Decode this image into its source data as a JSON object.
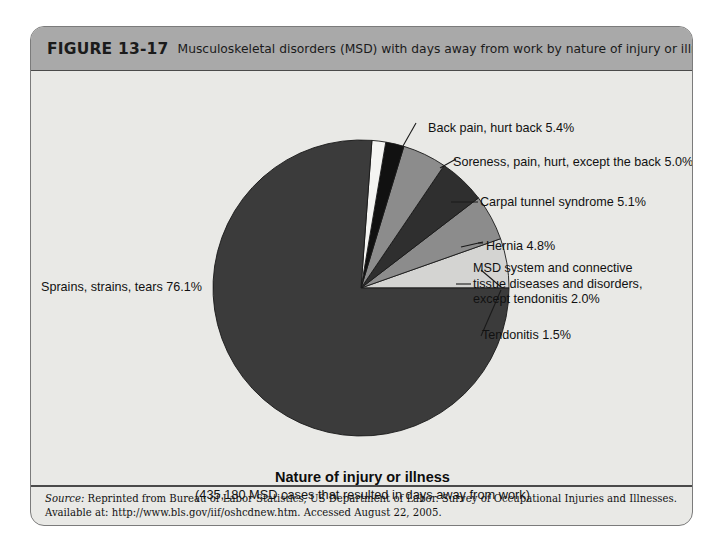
{
  "figure": {
    "number": "FIGURE 13-17",
    "caption": "Musculoskeletal disorders (MSD) with days away from work by nature of injury or illness, 2003."
  },
  "axis": {
    "title": "Nature of injury or illness",
    "subtitle": "(435,180 MSD cases that resulted in days away from work)"
  },
  "source": {
    "label": "Source:",
    "text": " Reprinted from Bureau of Labor Statistics, US Department of Labor. Survey of Occupational Injuries and Illnesses. Available at: http://www.bls.gov/iif/oshcdnew.htm. Accessed August 22, 2005."
  },
  "labels": {
    "sprains": "Sprains, strains, tears 76.1%",
    "back_pain": "Back pain, hurt back 5.4%",
    "soreness": "Soreness, pain, hurt, except the back 5.0%",
    "carpal": "Carpal tunnel syndrome 5.1%",
    "hernia": "Hernia 4.8%",
    "msd_system": "MSD system and connective tissue diseases and disorders, except tendonitis 2.0%",
    "tendonitis": "Tendonitis 1.5%"
  },
  "colors": {
    "header_band": "#a9a9a9",
    "panel_background": "#e9e9e6",
    "border": "#7b7b7b",
    "slice_sprains": "#3b3b3b",
    "slice_back_pain": "#d4d4d2",
    "slice_soreness": "#8c8c8c",
    "slice_carpal": "#2f2f2f",
    "slice_hernia": "#8c8c8c",
    "slice_msd_system": "#111111",
    "slice_tendonitis": "#f4f4f2",
    "leader_line": "#1a1a1a"
  },
  "chart_data": {
    "type": "pie",
    "title": "Musculoskeletal disorders (MSD) with days away from work by nature of injury or illness, 2003",
    "xlabel": "Nature of injury or illness",
    "ylabel": "",
    "total_cases": "435,180",
    "units": "percent of MSD cases",
    "legend_position": "callout-labels",
    "grid": false,
    "start_angle_deg": 0,
    "direction": "clockwise",
    "categories": [
      "Sprains, strains, tears",
      "Back pain, hurt back",
      "Soreness, pain, hurt, except the back",
      "Carpal tunnel syndrome",
      "Hernia",
      "MSD system and connective tissue diseases and disorders, except tendonitis",
      "Tendonitis"
    ],
    "values": [
      76.1,
      5.4,
      5.0,
      5.1,
      4.8,
      2.0,
      1.5
    ],
    "slices": [
      {
        "label": "Back pain, hurt back",
        "value": 5.4,
        "display": "5.4%",
        "color": "#d4d4d2"
      },
      {
        "label": "Soreness, pain, hurt, except the back",
        "value": 5.0,
        "display": "5.0%",
        "color": "#8c8c8c"
      },
      {
        "label": "Carpal tunnel syndrome",
        "value": 5.1,
        "display": "5.1%",
        "color": "#2f2f2f"
      },
      {
        "label": "Hernia",
        "value": 4.8,
        "display": "4.8%",
        "color": "#8c8c8c"
      },
      {
        "label": "MSD system and connective tissue diseases and disorders, except tendonitis",
        "value": 2.0,
        "display": "2.0%",
        "color": "#111111"
      },
      {
        "label": "Tendonitis",
        "value": 1.5,
        "display": "1.5%",
        "color": "#f4f4f2"
      },
      {
        "label": "Sprains, strains, tears",
        "value": 76.1,
        "display": "76.1%",
        "color": "#3b3b3b"
      }
    ]
  }
}
